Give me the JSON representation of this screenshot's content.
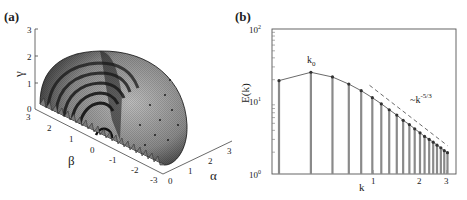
{
  "chart_data": [
    {
      "panel_label": "(a)",
      "type": "surface3d",
      "title": "",
      "xlabel": "α",
      "ylabel": "β",
      "zlabel": "γ",
      "x_ticks": [
        "0",
        "1",
        "2",
        "3"
      ],
      "y_ticks": [
        "3",
        "2",
        "1",
        "0",
        "-1",
        "-2",
        "-3"
      ],
      "z_ticks": [
        "0",
        "1",
        "2",
        "3"
      ],
      "xlim": [
        0,
        3
      ],
      "ylim": [
        -3,
        3
      ],
      "zlim": [
        0,
        3
      ],
      "description": "Half-dome shaped set of concentric shells (spherical shells of radius ~2.2) in (α, β, γ) space, grayscale mesh, with sawtooth edges along the β axis at γ=0"
    },
    {
      "panel_label": "(b)",
      "type": "line",
      "title": "",
      "xlabel": "k",
      "ylabel": "E(k)",
      "xscale": "log",
      "yscale": "log",
      "x_ticks": [
        "1",
        "2",
        "3"
      ],
      "y_ticks": [
        "10^0",
        "10^1",
        "10^2"
      ],
      "ylim": [
        1,
        100
      ],
      "grid": false,
      "style": "stems with markers connected by a line",
      "annotations": [
        {
          "text": "k",
          "sub": "0",
          "near_k": 0.41
        },
        {
          "text": "~k",
          "sup": "-5/3",
          "near_k": 1.8
        }
      ],
      "reference_line": {
        "label": "~k^-5/3",
        "style": "dashed",
        "k_range": [
          0.95,
          3.0
        ]
      },
      "series": [
        {
          "name": "E(k)",
          "x": [
            0.25,
            0.4,
            0.55,
            0.7,
            0.84,
            0.99,
            1.13,
            1.27,
            1.42,
            1.56,
            1.71,
            1.85,
            2.0,
            2.14,
            2.29,
            2.43,
            2.57,
            2.72,
            2.86,
            3.0
          ],
          "values": [
            19.4,
            25.3,
            21.8,
            17.4,
            14.1,
            11.3,
            9.3,
            7.7,
            6.5,
            5.5,
            4.8,
            4.2,
            3.7,
            3.3,
            3.0,
            2.75,
            2.5,
            2.3,
            2.1,
            1.97
          ]
        }
      ]
    }
  ]
}
